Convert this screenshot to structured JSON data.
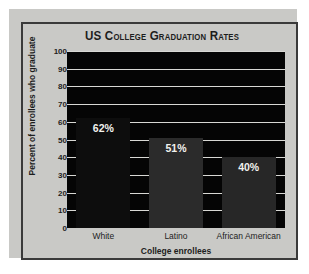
{
  "chart_data": {
    "type": "bar",
    "title": "US College Graduation Rates",
    "xlabel": "College enrollees",
    "ylabel": "Percent of enrollees who graduate",
    "categories": [
      "White",
      "Latino",
      "African American"
    ],
    "values": [
      62,
      51,
      40
    ],
    "data_labels": [
      "62%",
      "51%",
      "40%"
    ],
    "ylim": [
      0,
      100
    ],
    "ytick_values": [
      100,
      90,
      80,
      70,
      60,
      50,
      40,
      30,
      20,
      10,
      0
    ],
    "ytick_labels": [
      "100",
      "90",
      "80",
      "70",
      "60",
      "50",
      "40",
      "30",
      "20",
      "10",
      "0"
    ],
    "grid": true,
    "legend": false,
    "colors": {
      "plot_background": "#050505",
      "panel_background": "#c9c9c6",
      "frame": "#3a3a3a",
      "gridline": "#d8d8d4",
      "text": "#1d1d1d",
      "data_label": "#f2f2ee",
      "bar_white": "#0d0d0d",
      "bar_latino": "#2b2b2b",
      "bar_african_american": "#272727"
    }
  }
}
